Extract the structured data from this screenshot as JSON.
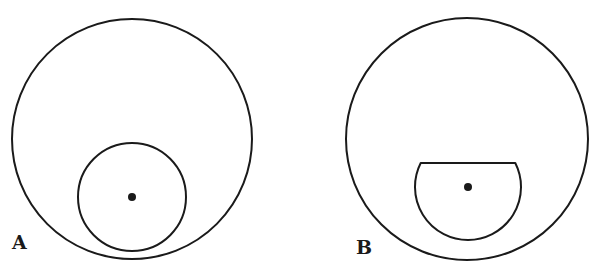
{
  "figure": {
    "panels": [
      {
        "label": "A",
        "outer_circle": {
          "cx": 132,
          "cy": 139,
          "r": 120
        },
        "inner_shape": "circle",
        "inner_circle": {
          "cx": 132,
          "cy": 197,
          "r": 54
        },
        "center_dot": {
          "cx": 132,
          "cy": 197,
          "r": 4
        }
      },
      {
        "label": "B",
        "outer_circle": {
          "cx": 467,
          "cy": 139,
          "r": 121
        },
        "inner_shape": "truncated-circle",
        "inner_truncated_circle": {
          "cx": 468,
          "cy": 187,
          "r": 53,
          "chord_y": 163
        },
        "center_dot": {
          "cx": 468,
          "cy": 187,
          "r": 4
        }
      }
    ],
    "stroke_color": "#1a1a1a",
    "background": "#ffffff"
  }
}
